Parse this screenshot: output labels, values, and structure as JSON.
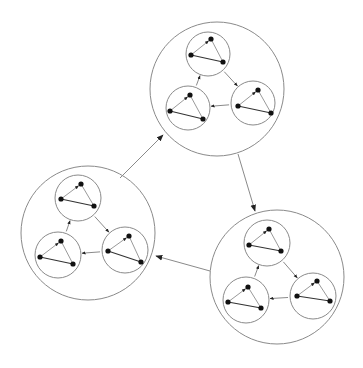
{
  "diagram": {
    "colors": {
      "background": "#ffffff",
      "circle_stroke": "#8a8a8a",
      "node_fill": "#111111",
      "edge_light": "#9a9a9a",
      "edge_dark": "#333333"
    },
    "clusters": [
      {
        "id": "top",
        "cx": 217,
        "cy": 89,
        "r": 67,
        "subclusters": [
          {
            "id": "top-a",
            "cx": 208,
            "cy": 54,
            "r": 22,
            "nodes": [
              [
                211,
                39
              ],
              [
                191,
                55
              ],
              [
                223,
                62
              ]
            ]
          },
          {
            "id": "top-b",
            "cx": 253,
            "cy": 103,
            "r": 22,
            "nodes": [
              [
                258,
                90
              ],
              [
                238,
                106
              ],
              [
                271,
                113
              ]
            ]
          },
          {
            "id": "top-c",
            "cx": 188,
            "cy": 108,
            "r": 22,
            "nodes": [
              [
                190,
                95
              ],
              [
                170,
                111
              ],
              [
                203,
                119
              ]
            ]
          }
        ]
      },
      {
        "id": "right",
        "cx": 277,
        "cy": 277,
        "r": 67,
        "subclusters": [
          {
            "id": "right-a",
            "cx": 267,
            "cy": 243,
            "r": 23,
            "nodes": [
              [
                269,
                229
              ],
              [
                249,
                245
              ],
              [
                281,
                251
              ]
            ]
          },
          {
            "id": "right-b",
            "cx": 313,
            "cy": 296,
            "r": 23,
            "nodes": [
              [
                317,
                281
              ],
              [
                297,
                296
              ],
              [
                330,
                301
              ]
            ]
          },
          {
            "id": "right-c",
            "cx": 246,
            "cy": 300,
            "r": 23,
            "nodes": [
              [
                248,
                287
              ],
              [
                228,
                302
              ],
              [
                261,
                308
              ]
            ]
          }
        ]
      },
      {
        "id": "left",
        "cx": 88,
        "cy": 233,
        "r": 67,
        "subclusters": [
          {
            "id": "left-a",
            "cx": 78,
            "cy": 198,
            "r": 23,
            "nodes": [
              [
                81,
                184
              ],
              [
                61,
                199
              ],
              [
                94,
                206
              ]
            ]
          },
          {
            "id": "left-b",
            "cx": 125,
            "cy": 250,
            "r": 23,
            "nodes": [
              [
                129,
                236
              ],
              [
                108,
                251
              ],
              [
                141,
                262
              ]
            ]
          },
          {
            "id": "left-c",
            "cx": 58,
            "cy": 255,
            "r": 23,
            "nodes": [
              [
                61,
                241
              ],
              [
                40,
                257
              ],
              [
                73,
                264
              ]
            ]
          }
        ]
      }
    ],
    "cluster_links": [
      {
        "from": "left",
        "to": "top",
        "x1": 120,
        "y1": 178,
        "x2": 163,
        "y2": 135
      },
      {
        "from": "top",
        "to": "right",
        "x1": 238,
        "y1": 154,
        "x2": 255,
        "y2": 211
      },
      {
        "from": "right",
        "to": "left",
        "x1": 210,
        "y1": 271,
        "x2": 156,
        "y2": 256
      }
    ]
  }
}
